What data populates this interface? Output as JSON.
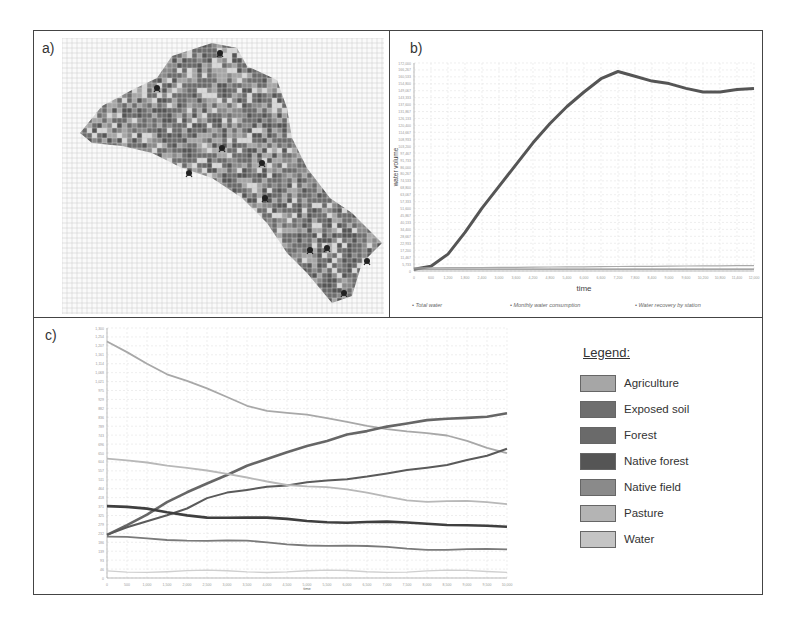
{
  "figure": {
    "panel_a_label": "a)",
    "panel_b_label": "b)",
    "panel_c_label": "c)"
  },
  "map": {
    "description": "Gridded raster map of a watershed colored by land-use class, with station markers",
    "grid_color": "#bfbfbf",
    "station_icon": "station-marker-icon",
    "station_count": 10
  },
  "chart_data": [
    {
      "id": "b",
      "type": "line",
      "title": "",
      "xlabel": "time",
      "ylabel": "water volume",
      "xlim": [
        0,
        12000
      ],
      "ylim": [
        0,
        172000
      ],
      "grid": true,
      "legend_position": "bottom",
      "x": [
        0,
        600,
        1200,
        1800,
        2400,
        3000,
        3600,
        4200,
        4800,
        5400,
        6000,
        6600,
        7200,
        7800,
        8400,
        9000,
        9600,
        10200,
        10800,
        11400,
        12000
      ],
      "series": [
        {
          "name": "Total water",
          "color": "#555555",
          "values": [
            1500,
            4000,
            14000,
            32000,
            52000,
            70000,
            88000,
            106000,
            122000,
            136000,
            148000,
            159000,
            165000,
            161000,
            157000,
            155000,
            151000,
            148000,
            148000,
            150000,
            151000
          ]
        },
        {
          "name": "Monthly water consumption",
          "color": "#888888",
          "values": [
            1500,
            1500,
            1500,
            1500,
            1500,
            1500,
            1500,
            1500,
            1500,
            1500,
            1500,
            1500,
            1500,
            1500,
            1500,
            1500,
            1500,
            1500,
            1500,
            1500,
            1500
          ]
        },
        {
          "name": "Water recovery by station",
          "color": "#aaaaaa",
          "values": [
            2500,
            2600,
            2700,
            2800,
            2900,
            3000,
            3100,
            3200,
            3300,
            3400,
            3500,
            3600,
            3700,
            3800,
            3900,
            4000,
            4100,
            4200,
            4300,
            4400,
            4500
          ]
        }
      ]
    },
    {
      "id": "c",
      "type": "line",
      "title": "",
      "xlabel": "time",
      "ylabel": "",
      "xlim": [
        0,
        10000
      ],
      "ylim": [
        0,
        1300
      ],
      "grid": true,
      "legend_position": "right",
      "x": [
        0,
        500,
        1000,
        1500,
        2000,
        2500,
        3000,
        3500,
        4000,
        4500,
        5000,
        5500,
        6000,
        6500,
        7000,
        7500,
        8000,
        8500,
        9000,
        9500,
        10000
      ],
      "series": [
        {
          "name": "Agriculture",
          "color": "#a8a8a8",
          "values": [
            1230,
            1180,
            1120,
            1060,
            1020,
            980,
            940,
            900,
            875,
            860,
            845,
            825,
            810,
            795,
            780,
            765,
            750,
            735,
            710,
            680,
            655
          ]
        },
        {
          "name": "Exposed soil",
          "color": "#666666",
          "values": [
            230,
            280,
            330,
            390,
            440,
            490,
            540,
            590,
            620,
            650,
            680,
            710,
            750,
            770,
            790,
            800,
            815,
            825,
            835,
            845,
            860
          ]
        },
        {
          "name": "Forest",
          "color": "#5a5a5a",
          "values": [
            230,
            265,
            290,
            320,
            360,
            420,
            450,
            460,
            470,
            475,
            495,
            510,
            520,
            530,
            540,
            555,
            570,
            590,
            620,
            640,
            670
          ]
        },
        {
          "name": "Native forest",
          "color": "#3f3f3f",
          "values": [
            375,
            365,
            355,
            340,
            330,
            320,
            315,
            310,
            308,
            305,
            300,
            296,
            290,
            288,
            287,
            285,
            285,
            282,
            278,
            270,
            260
          ]
        },
        {
          "name": "Native field",
          "color": "#7a7a7a",
          "values": [
            210,
            208,
            205,
            202,
            200,
            195,
            192,
            188,
            183,
            178,
            175,
            170,
            165,
            160,
            158,
            155,
            153,
            150,
            148,
            146,
            145
          ]
        },
        {
          "name": "Pasture",
          "color": "#b8b8b8",
          "values": [
            615,
            610,
            605,
            590,
            575,
            555,
            535,
            520,
            505,
            490,
            480,
            470,
            455,
            440,
            425,
            410,
            400,
            398,
            395,
            390,
            385
          ]
        },
        {
          "name": "Water",
          "color": "#cfcfcf",
          "values": [
            35,
            35,
            35,
            35,
            35,
            35,
            35,
            35,
            35,
            35,
            35,
            35,
            35,
            35,
            35,
            35,
            35,
            35,
            35,
            35,
            35
          ]
        }
      ]
    }
  ],
  "chart_b": {
    "xlabel": "time",
    "ylabel": "water volume",
    "legend": [
      "Total water",
      "Monthly water consumption",
      "Water recovery by station"
    ]
  },
  "chart_c": {
    "xlabel": "time"
  },
  "legend": {
    "title": "Legend:",
    "items": [
      {
        "label": "Agriculture",
        "color": "#a6a6a6"
      },
      {
        "label": "Exposed soil",
        "color": "#6e6e6e"
      },
      {
        "label": "Forest",
        "color": "#6a6a6a"
      },
      {
        "label": "Native forest",
        "color": "#555555"
      },
      {
        "label": "Native field",
        "color": "#8a8a8a"
      },
      {
        "label": "Pasture",
        "color": "#b4b4b4"
      },
      {
        "label": "Water",
        "color": "#c4c4c4"
      }
    ]
  }
}
